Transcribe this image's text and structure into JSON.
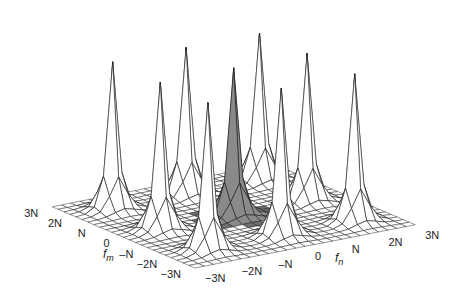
{
  "chart_data": {
    "type": "heatmap",
    "subtype": "3d-surface-mesh",
    "title": "",
    "x_axis": {
      "label": "f",
      "label_subscript": "n",
      "ticks": [
        "−3N",
        "−2N",
        "–N",
        "0",
        "N",
        "2N",
        "3N"
      ],
      "range": [
        -3,
        3
      ],
      "unit": "N"
    },
    "y_axis": {
      "label": "f",
      "label_subscript": "m",
      "ticks": [
        "−3N",
        "−2N",
        "–N",
        "0",
        "N",
        "2N",
        "3N"
      ],
      "range": [
        -3,
        3
      ],
      "unit": "N"
    },
    "grid": true,
    "grid_cells_per_axis": 24,
    "peaks": [
      {
        "fm": 2,
        "fn": -2,
        "height": 1.0,
        "highlighted": false
      },
      {
        "fm": 2,
        "fn": 0,
        "height": 1.0,
        "highlighted": false
      },
      {
        "fm": 2,
        "fn": 2,
        "height": 1.0,
        "highlighted": false
      },
      {
        "fm": 0,
        "fn": -2,
        "height": 1.0,
        "highlighted": false
      },
      {
        "fm": 0,
        "fn": 0,
        "height": 1.0,
        "highlighted": true
      },
      {
        "fm": 0,
        "fn": 2,
        "height": 1.0,
        "highlighted": false
      },
      {
        "fm": -2,
        "fn": -2,
        "height": 1.0,
        "highlighted": false
      },
      {
        "fm": -2,
        "fn": 0,
        "height": 1.0,
        "highlighted": false
      },
      {
        "fm": -2,
        "fn": 2,
        "height": 1.0,
        "highlighted": false
      }
    ],
    "colors": {
      "surface": "#ffffff",
      "highlight": "#8a8a8a",
      "highlight_floor": "#6e6e6e",
      "mesh_line": "#1a1a1a"
    }
  }
}
